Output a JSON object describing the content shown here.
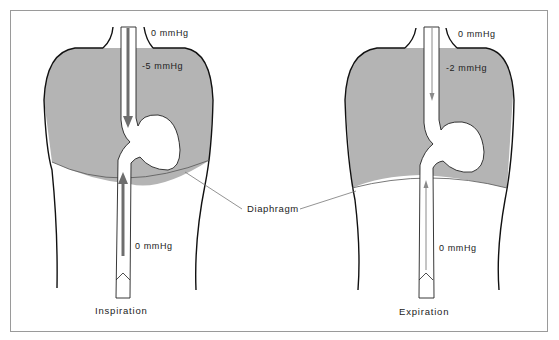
{
  "figure": {
    "colors": {
      "thorax_fill": "#b4b4b4",
      "outline": "#111111",
      "arrow_strong": "#6e6e6e",
      "arrow_weak": "#8a8a8a",
      "leader_line": "#777777",
      "frame": "#9a9a9a"
    },
    "panels": [
      {
        "caption": "Inspiration",
        "pressure_top": "0 mmHg",
        "pressure_thorax": "-5 mmHg",
        "pressure_abdomen": "0 mmHg",
        "arrow_style": "thick"
      },
      {
        "caption": "Expiration",
        "pressure_top": "0 mmHg",
        "pressure_thorax": "-2 mmHg",
        "pressure_abdomen": "0 mmHg",
        "arrow_style": "thin"
      }
    ],
    "shared_label": "Diaphragm"
  }
}
